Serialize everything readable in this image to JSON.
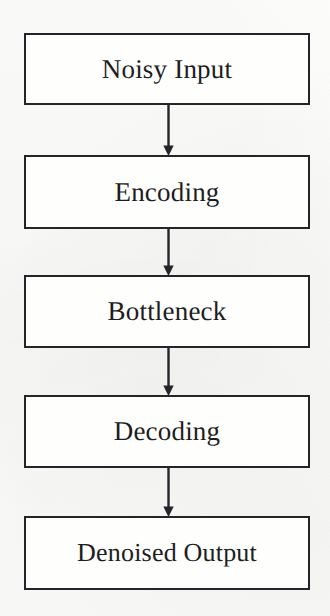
{
  "diagram": {
    "type": "flowchart",
    "orientation": "vertical",
    "background_color": "#fdfdfb",
    "stroke_color": "#24242a",
    "text_color": "#1d1d22",
    "nodes": [
      {
        "id": "noisy-input",
        "label": "Noisy Input"
      },
      {
        "id": "encoding",
        "label": "Encoding"
      },
      {
        "id": "bottleneck",
        "label": "Bottleneck"
      },
      {
        "id": "decoding",
        "label": "Decoding"
      },
      {
        "id": "denoised-output",
        "label": "Denoised Output"
      }
    ],
    "connectors": [
      {
        "id": "noisy-input-to-encoding",
        "from": "Noisy Input",
        "to": "Encoding",
        "marker": "arrowhead-down"
      },
      {
        "id": "encoding-to-bottleneck",
        "from": "Encoding",
        "to": "Bottleneck",
        "marker": "arrowhead-down"
      },
      {
        "id": "bottleneck-to-decoding",
        "from": "Bottleneck",
        "to": "Decoding",
        "marker": "arrowhead-down"
      },
      {
        "id": "decoding-to-denoised-output",
        "from": "Decoding",
        "to": "Denoised Output",
        "marker": "arrowhead-down"
      }
    ]
  }
}
